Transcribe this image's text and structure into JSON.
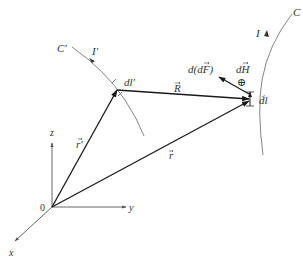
{
  "diagram": {
    "type": "biot-savart-ampere-force-geometry",
    "colors": {
      "vector": "#1a1a1a",
      "axis": "#555555",
      "curve": "#777777",
      "text": "#333333",
      "background": "#ffffff"
    },
    "axes": {
      "origin_label": "0",
      "x_label": "x",
      "y_label": "y",
      "z_label": "z"
    },
    "curves": {
      "source_curve_label": "C'",
      "source_current_label": "I'",
      "field_curve_label": "C",
      "field_current_label": "I"
    },
    "elements": {
      "source_element_label": "dl'",
      "field_element_label": "dl"
    },
    "vectors": {
      "r_prime_label": "r'",
      "r_label": "r",
      "R_label": "R",
      "dH_label": "dH",
      "dH_symbol": "⊕",
      "force_label": "d(dF)"
    }
  }
}
